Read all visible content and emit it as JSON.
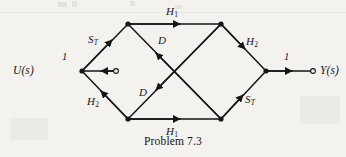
{
  "figure": {
    "caption": "Problem 7.3",
    "input_terminal": "U(s)",
    "output_terminal": "Y(s)",
    "input_gain": "1",
    "output_gain": "1",
    "background_color": "#f4f2ee",
    "ink_color": "#15151a"
  },
  "edge_labels": {
    "top": {
      "symbol": "H",
      "subscript": "1"
    },
    "bottom": {
      "symbol": "H",
      "subscript": "1"
    },
    "upper_left": {
      "symbol": "S",
      "subscript": "T"
    },
    "lower_left": {
      "symbol": "H",
      "subscript": "2"
    },
    "upper_right": {
      "symbol": "H",
      "subscript": "2"
    },
    "lower_right": {
      "symbol": "S",
      "subscript": "T"
    },
    "diagonal_upper": {
      "symbol": "D",
      "subscript": ""
    },
    "diagonal_lower": {
      "symbol": "D",
      "subscript": ""
    }
  },
  "nodes": [
    {
      "name": "input-terminal-node",
      "x": 115,
      "y": 71
    },
    {
      "name": "left-summing-node",
      "x": 82,
      "y": 71
    },
    {
      "name": "top-left-node",
      "x": 128,
      "y": 24
    },
    {
      "name": "top-right-node",
      "x": 221,
      "y": 24
    },
    {
      "name": "bottom-left-node",
      "x": 128,
      "y": 119
    },
    {
      "name": "bottom-right-node",
      "x": 221,
      "y": 119
    },
    {
      "name": "right-summing-node",
      "x": 266,
      "y": 71
    },
    {
      "name": "output-terminal-node",
      "x": 313,
      "y": 71
    }
  ]
}
